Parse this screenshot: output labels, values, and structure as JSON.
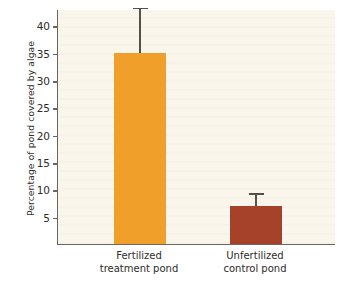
{
  "chart_data": {
    "type": "bar",
    "title": "",
    "xlabel": "",
    "ylabel": "Percentage of pond covered by algae",
    "categories": [
      "Fertilized treatment pond",
      "Unfertilized control pond"
    ],
    "category_lines": [
      [
        "Fertilized",
        "treatment pond"
      ],
      [
        "Unfertilized",
        "control pond"
      ]
    ],
    "values": [
      35,
      7
    ],
    "errors_upper": [
      43,
      9
    ],
    "error_magnitude": [
      8,
      2
    ],
    "bar_colors": [
      "#f0a02a",
      "#a6412a"
    ],
    "ylim": [
      0,
      43
    ],
    "yticks": [
      5,
      10,
      15,
      20,
      25,
      30,
      35,
      40
    ],
    "ytick_labels": [
      "5",
      "10",
      "15",
      "20",
      "25",
      "30",
      "35",
      "40"
    ],
    "grid": false,
    "legend": "none",
    "plot_background": "#faf6ec",
    "page_background": "#ffffff",
    "axis_color": "#6b6660",
    "error_bar_color": "#55504a"
  }
}
